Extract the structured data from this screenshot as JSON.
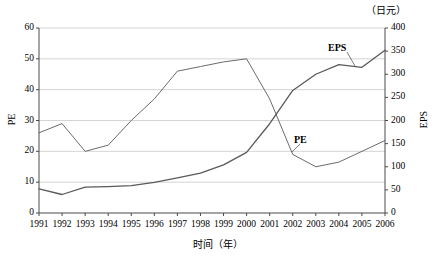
{
  "chart_data": {
    "type": "line",
    "title": "",
    "xlabel": "时间（年）",
    "x": [
      "1991",
      "1992",
      "1993",
      "1994",
      "1995",
      "1996",
      "1997",
      "1998",
      "1999",
      "2000",
      "2001",
      "2002",
      "2003",
      "2004",
      "2005",
      "2006"
    ],
    "grid": true,
    "legend_position": "inline-annotation",
    "axes": {
      "left": {
        "label": "PE",
        "unit": "",
        "min": 0,
        "max": 60,
        "ticks": [
          "0",
          "10",
          "20",
          "30",
          "40",
          "50",
          "60"
        ]
      },
      "right": {
        "label": "EPS",
        "unit": "（日元）",
        "min": 0,
        "max": 400,
        "ticks": [
          "0",
          "50",
          "100",
          "150",
          "200",
          "250",
          "300",
          "350",
          "400"
        ]
      }
    },
    "series": [
      {
        "name": "PE",
        "axis": "left",
        "annotation": "PE",
        "values": [
          26,
          29,
          20,
          22,
          30,
          37,
          46,
          47.5,
          49,
          50,
          37,
          19,
          15,
          16.5,
          20,
          23.5
        ]
      },
      {
        "name": "EPS",
        "axis": "right",
        "annotation": "EPS",
        "values": [
          52,
          40,
          56,
          57,
          59,
          66,
          76,
          86,
          104,
          131,
          193,
          265,
          300,
          321,
          315,
          352
        ]
      }
    ]
  }
}
